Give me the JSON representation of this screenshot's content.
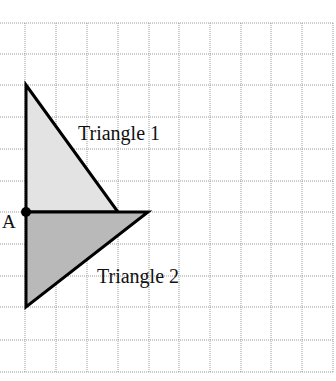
{
  "diagram": {
    "type": "grid-geometry",
    "grid": {
      "x_lines": [
        25,
        56,
        87,
        118,
        149,
        179,
        210,
        241,
        271,
        302,
        333
      ],
      "y_lines": [
        23,
        54,
        85,
        117,
        149,
        181,
        212,
        244,
        276,
        307,
        340,
        372
      ],
      "line_color": "#9a9a9a"
    },
    "point_A": {
      "label": "A",
      "x": 26,
      "y": 212
    },
    "triangles": [
      {
        "label": "Triangle 1",
        "fill": "#e3e3e3",
        "vertices": [
          [
            26,
            85
          ],
          [
            26,
            212
          ],
          [
            118,
            212
          ]
        ],
        "label_pos": [
          78,
          140
        ]
      },
      {
        "label": "Triangle 2",
        "fill": "#b9b9b9",
        "vertices": [
          [
            26,
            212
          ],
          [
            148,
            212
          ],
          [
            26,
            307
          ]
        ],
        "label_pos": [
          97,
          283
        ]
      }
    ]
  }
}
